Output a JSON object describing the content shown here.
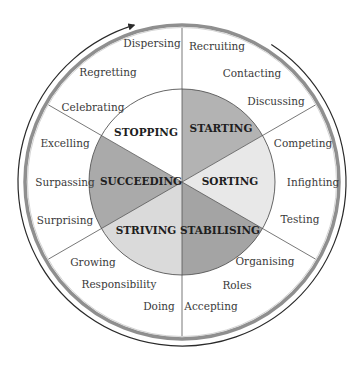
{
  "diagram": {
    "center": [
      182,
      182
    ],
    "inner_radius": 93,
    "outer_radius": 154,
    "arc_direction": "clockwise",
    "colors": {
      "line": "#555555",
      "ring_gray": "#8a8a8a",
      "outer_arc": "#2a2a2a"
    },
    "sectors": [
      {
        "label": "STARTING",
        "start_deg": -90,
        "end_deg": -30,
        "fill": "#b3b3b3",
        "label_pos": [
          221,
          132
        ]
      },
      {
        "label": "SORTING",
        "start_deg": -30,
        "end_deg": 30,
        "fill": "#e8e8e8",
        "label_pos": [
          230,
          185
        ]
      },
      {
        "label": "STABILISING",
        "start_deg": 30,
        "end_deg": 90,
        "fill": "#a4a4a4",
        "label_pos": [
          220,
          234
        ]
      },
      {
        "label": "STRIVING",
        "start_deg": 90,
        "end_deg": 150,
        "fill": "#dadada",
        "label_pos": [
          146,
          234
        ]
      },
      {
        "label": "SUCCEEDING",
        "start_deg": 150,
        "end_deg": 210,
        "fill": "#aaaaaa",
        "label_pos": [
          141,
          185
        ]
      },
      {
        "label": "STOPPING",
        "start_deg": 210,
        "end_deg": 270,
        "fill": "#ffffff",
        "label_pos": [
          146,
          136
        ]
      }
    ],
    "outer_labels": [
      {
        "text": "Recruiting",
        "pos": [
          217,
          50
        ]
      },
      {
        "text": "Contacting",
        "pos": [
          252,
          77
        ]
      },
      {
        "text": "Discussing",
        "pos": [
          276,
          105
        ]
      },
      {
        "text": "Competing",
        "pos": [
          303,
          147
        ]
      },
      {
        "text": "Infighting",
        "pos": [
          313,
          186
        ]
      },
      {
        "text": "Testing",
        "pos": [
          300,
          223
        ]
      },
      {
        "text": "Organising",
        "pos": [
          265,
          265
        ]
      },
      {
        "text": "Roles",
        "pos": [
          237,
          289
        ]
      },
      {
        "text": "Accepting",
        "pos": [
          211,
          310
        ]
      },
      {
        "text": "Doing",
        "pos": [
          159,
          310
        ]
      },
      {
        "text": "Responsibility",
        "pos": [
          119,
          288
        ]
      },
      {
        "text": "Growing",
        "pos": [
          93,
          266
        ]
      },
      {
        "text": "Surprising",
        "pos": [
          65,
          224
        ]
      },
      {
        "text": "Surpassing",
        "pos": [
          65,
          186
        ]
      },
      {
        "text": "Excelling",
        "pos": [
          65,
          147
        ]
      },
      {
        "text": "Celebrating",
        "pos": [
          93,
          111
        ]
      },
      {
        "text": "Regretting",
        "pos": [
          108,
          76
        ]
      },
      {
        "text": "Dispersing",
        "pos": [
          152,
          47
        ]
      }
    ]
  }
}
